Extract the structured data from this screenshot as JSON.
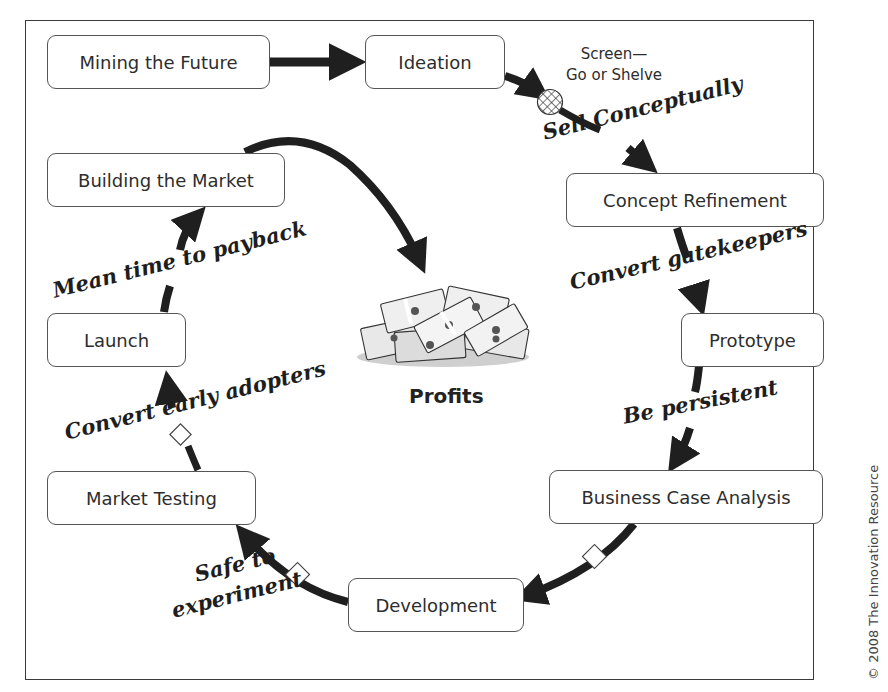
{
  "diagram": {
    "center": {
      "label": "Profits",
      "icon": "money-pile-icon"
    },
    "stages": [
      {
        "id": "mining",
        "label": "Mining the Future"
      },
      {
        "id": "ideation",
        "label": "Ideation"
      },
      {
        "id": "concept",
        "label": "Concept Refinement"
      },
      {
        "id": "prototype",
        "label": "Prototype"
      },
      {
        "id": "business",
        "label": "Business Case Analysis"
      },
      {
        "id": "development",
        "label": "Development"
      },
      {
        "id": "testing",
        "label": "Market Testing"
      },
      {
        "id": "launch",
        "label": "Launch"
      },
      {
        "id": "building",
        "label": "Building the Market"
      }
    ],
    "gate": {
      "line1": "Screen—",
      "line2": "Go or Shelve"
    },
    "transition_labels": {
      "sell": "Sell Conceptually",
      "gatekeepers": "Convert gatekeepers",
      "persistent": "Be persistent",
      "safe_line1": "Safe to",
      "safe_line2": "experiment",
      "early": "Convert early adopters",
      "payback": "Mean time to payback"
    },
    "copyright": "© 2008 The Innovation Resource",
    "colors": {
      "arrow": "#1f1f1f",
      "border": "#555555",
      "text": "#2d2d2d"
    }
  }
}
